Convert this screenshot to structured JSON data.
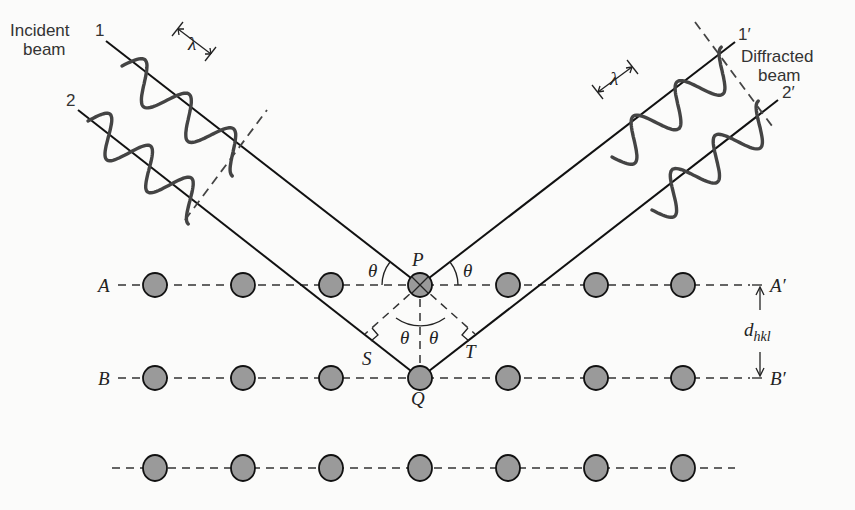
{
  "figure": {
    "colors": {
      "background": "#fbfbfa",
      "atom_fill": "#9a9a9a",
      "ray": "#111111",
      "wave": "#444444"
    }
  },
  "labels": {
    "incident_beam": [
      "Incident",
      "beam"
    ],
    "diffracted_beam": [
      "Diffracted",
      "beam"
    ],
    "ray1": "1",
    "ray2": "2",
    "ray1p": "1′",
    "ray2p": "2′",
    "wavelength": "λ",
    "P": "P",
    "Q": "Q",
    "S": "S",
    "T": "T",
    "theta": "θ",
    "A": "A",
    "B": "B",
    "Ap": "A′",
    "Bp": "B′",
    "d": "d",
    "d_sub": "hkl"
  },
  "lattice": {
    "atom_x": [
      155,
      243,
      331,
      420,
      508,
      596,
      683
    ],
    "rows": [
      {
        "name": "A",
        "y": 285
      },
      {
        "name": "B",
        "y": 378
      },
      {
        "name": "C",
        "y": 468
      }
    ],
    "atom_radius": 12
  },
  "geometry": {
    "P": [
      420,
      285
    ],
    "Q": [
      420,
      378
    ],
    "ray1_start": [
      106,
      41
    ],
    "ray2_start": [
      78,
      110
    ],
    "ray1p_end": [
      735,
      42
    ],
    "ray2p_end": [
      778,
      100
    ]
  }
}
